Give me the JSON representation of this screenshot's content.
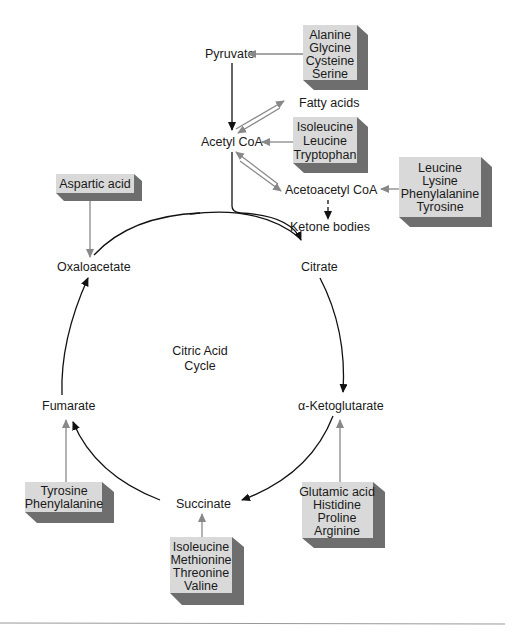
{
  "diagram": {
    "center_label": [
      "Citric Acid",
      "Cycle"
    ],
    "metabolites": {
      "pyruvate": "Pyruvate",
      "acetyl_coa": "Acetyl CoA",
      "fatty_acids": "Fatty acids",
      "acetoacetyl_coa": "Acetoacetyl CoA",
      "ketone_bodies": "Ketone bodies",
      "oxaloacetate": "Oxaloacetate",
      "citrate": "Citrate",
      "alpha_ketoglutarate": "α-Ketoglutarate",
      "succinate": "Succinate",
      "fumarate": "Fumarate"
    },
    "amino_acid_boxes": {
      "to_pyruvate": [
        "Alanine",
        "Glycine",
        "Cysteine",
        "Serine"
      ],
      "to_acetyl_coa": [
        "Isoleucine",
        "Leucine",
        "Tryptophan"
      ],
      "to_acetoacetyl_coa": [
        "Leucine",
        "Lysine",
        "Phenylalanine",
        "Tyrosine"
      ],
      "to_oxaloacetate": [
        "Aspartic acid"
      ],
      "to_fumarate": [
        "Tyrosine",
        "Phenylalanine"
      ],
      "to_succinate": [
        "Isoleucine",
        "Methionine",
        "Threonine",
        "Valine"
      ],
      "to_alpha_ketoglutarate": [
        "Glutamic acid",
        "Histidine",
        "Proline",
        "Arginine"
      ]
    },
    "colors": {
      "box_face": "#d9d9d9",
      "box_shadow": "#6e6e6e",
      "feed_arrow": "#888888",
      "cycle_arrow": "#111111"
    }
  }
}
